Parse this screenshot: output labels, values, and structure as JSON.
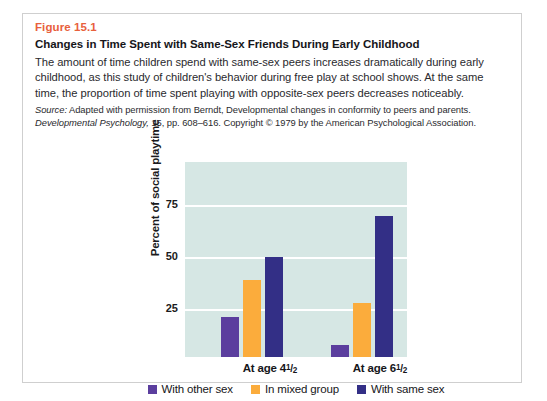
{
  "figure": {
    "number": "Figure 15.1",
    "title": "Changes in Time Spent with Same-Sex Friends During Early Childhood",
    "description": "The amount of time children spend with same-sex peers increases dramatically during early childhood, as this study of children's behavior during free play at school shows. At the same time, the proportion of time spent playing with opposite-sex peers decreases noticeably.",
    "source_label": "Source:",
    "source_line1": " Adapted with permission from Berndt, Developmental changes in conformity to peers and parents.",
    "source_journal": "Developmental Psychology,",
    "source_line2": " 15, pp. 608–616. Copyright © 1979 by the American Psychological Association."
  },
  "chart_data": {
    "type": "bar",
    "title": "",
    "xlabel": "",
    "ylabel": "Percent of social playtime",
    "categories": [
      "At age 4½",
      "At age 6½"
    ],
    "series": [
      {
        "name": "With other sex",
        "values": [
          19,
          6
        ],
        "color": "#5b3e9e"
      },
      {
        "name": "In mixed group",
        "values": [
          37,
          26
        ],
        "color": "#fbac3c"
      },
      {
        "name": "With same sex",
        "values": [
          48,
          68
        ],
        "color": "#332f86"
      }
    ],
    "ylim": [
      0,
      100
    ],
    "yticks": [
      25,
      50,
      75
    ],
    "ytick_labels": [
      "25",
      "50",
      "75"
    ],
    "grid": true,
    "legend_position": "bottom",
    "plot_background": "#d6e7e4"
  },
  "axis": {
    "group1_label_main": "At age 4",
    "group1_num": "1",
    "group1_den": "2",
    "group2_label_main": "At age 6",
    "group2_num": "1",
    "group2_den": "2",
    "slash": "/"
  },
  "colors": {
    "figure_number": "#e8603c",
    "plot_bg": "#d6e7e4",
    "card_border": "#cfcfcf",
    "text": "#16161a"
  }
}
